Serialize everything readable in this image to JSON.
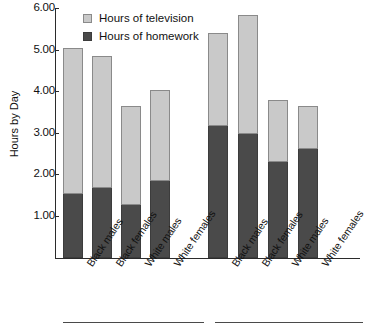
{
  "chart_data": {
    "type": "bar",
    "subtype": "stacked",
    "title": "",
    "xlabel": "",
    "ylabel": "Hours by Day",
    "ylim": [
      0,
      6.0
    ],
    "ytick_labels": [
      "1.00",
      "2.00",
      "3.00",
      "4.00",
      "5.00",
      "6.00"
    ],
    "ytick_values": [
      1.0,
      2.0,
      3.0,
      4.0,
      5.0,
      6.0
    ],
    "grid": false,
    "legend_position": "top-left",
    "legend": [
      {
        "label": "Hours of television",
        "color": "#c9c9c9"
      },
      {
        "label": "Hours of homework",
        "color": "#4a4a4a"
      }
    ],
    "categories": [
      "Black males",
      "Black females",
      "White males",
      "White females",
      "Black males",
      "Black females",
      "White males",
      "White females"
    ],
    "groups": [
      {
        "label": "",
        "categories": [
          "Black males",
          "Black females",
          "White males",
          "White females"
        ]
      },
      {
        "label": "",
        "categories": [
          "Black males",
          "Black females",
          "White males",
          "White females"
        ]
      }
    ],
    "series": [
      {
        "name": "Hours of homework",
        "color": "#4a4a4a",
        "values": [
          1.55,
          1.68,
          1.28,
          1.85,
          3.17,
          2.97,
          2.32,
          2.62
        ]
      },
      {
        "name": "Hours of television",
        "color": "#c9c9c9",
        "values": [
          3.5,
          3.17,
          2.37,
          2.2,
          2.25,
          2.86,
          1.48,
          1.03
        ]
      }
    ],
    "totals": [
      5.05,
      4.85,
      3.65,
      4.05,
      5.42,
      5.83,
      3.8,
      3.65
    ]
  },
  "colors": {
    "television": "#c9c9c9",
    "homework": "#4a4a4a",
    "axis": "#2b2b2b",
    "background": "#ffffff"
  }
}
